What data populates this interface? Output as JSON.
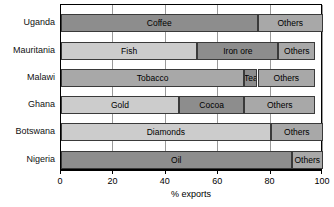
{
  "chart_data": {
    "type": "bar",
    "orientation": "horizontal",
    "stacked": true,
    "title": "",
    "xlabel": "% exports",
    "ylabel": "",
    "xlim": [
      0,
      100
    ],
    "xticks": [
      0,
      20,
      40,
      60,
      80,
      100
    ],
    "xtick_labels": [
      "0",
      "20",
      "40",
      "60",
      "80",
      "100"
    ],
    "grid": true,
    "legend": "none",
    "categories": [
      "Uganda",
      "Mauritania",
      "Malawi",
      "Ghana",
      "Botswana",
      "Nigeria"
    ],
    "bars": [
      {
        "category": "Uganda",
        "segments": [
          {
            "label": "Coffee",
            "value": 75,
            "start": 0,
            "end": 75,
            "shade": "dark"
          },
          {
            "label": "Others",
            "value": 25,
            "start": 75,
            "end": 100,
            "shade": "mid"
          }
        ]
      },
      {
        "category": "Mauritania",
        "segments": [
          {
            "label": "Fish",
            "value": 52,
            "start": 0,
            "end": 52,
            "shade": "light"
          },
          {
            "label": "Iron ore",
            "value": 31,
            "start": 52,
            "end": 83,
            "shade": "dark"
          },
          {
            "label": "Others",
            "value": 14,
            "start": 83,
            "end": 97,
            "shade": "mid"
          }
        ]
      },
      {
        "category": "Malawi",
        "segments": [
          {
            "label": "Tobacco",
            "value": 70,
            "start": 0,
            "end": 70,
            "shade": "mid"
          },
          {
            "label": "Tea",
            "value": 5,
            "start": 70,
            "end": 75,
            "shade": "dark"
          },
          {
            "label": "Others",
            "value": 22,
            "start": 75,
            "end": 97,
            "shade": "mid"
          }
        ]
      },
      {
        "category": "Ghana",
        "segments": [
          {
            "label": "Gold",
            "value": 45,
            "start": 0,
            "end": 45,
            "shade": "light"
          },
          {
            "label": "Cocoa",
            "value": 25,
            "start": 45,
            "end": 70,
            "shade": "dark"
          },
          {
            "label": "Others",
            "value": 27,
            "start": 70,
            "end": 97,
            "shade": "mid"
          }
        ]
      },
      {
        "category": "Botswana",
        "segments": [
          {
            "label": "Diamonds",
            "value": 80,
            "start": 0,
            "end": 80,
            "shade": "light"
          },
          {
            "label": "Others",
            "value": 20,
            "start": 80,
            "end": 100,
            "shade": "mid"
          }
        ]
      },
      {
        "category": "Nigeria",
        "segments": [
          {
            "label": "Oil",
            "value": 88,
            "start": 0,
            "end": 88,
            "shade": "dark"
          },
          {
            "label": "Others",
            "value": 12,
            "start": 88,
            "end": 100,
            "shade": "mid"
          }
        ]
      }
    ],
    "colors": {
      "dark": "#8d8d8d",
      "mid": "#a8a8a8",
      "light": "#cccccc",
      "outline": "#3a3a3a",
      "grid": "#9a9a9a",
      "axis": "#000000",
      "background": "#ffffff"
    }
  }
}
